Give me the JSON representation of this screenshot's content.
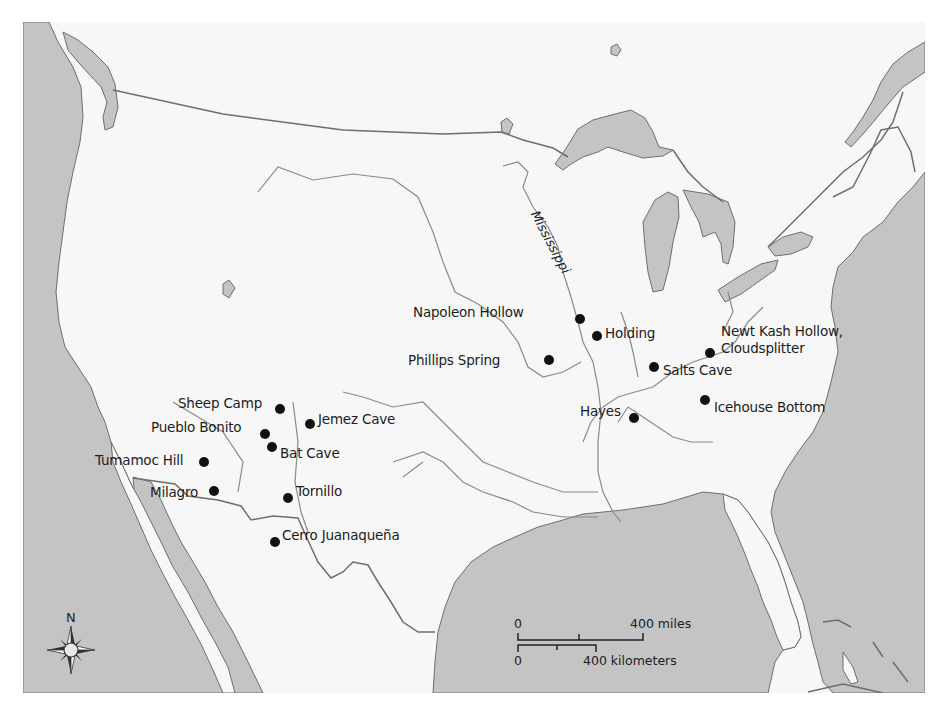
{
  "map": {
    "colors": {
      "land": "#f7f7f7",
      "water": "#c4c4c4",
      "border": "#6e6e6e",
      "river": "#8a8a8a",
      "site_dot": "#111111"
    },
    "river_labels": [
      {
        "id": "mississippi",
        "label": "Mississippi"
      }
    ],
    "sites": [
      {
        "id": "napoleon-hollow",
        "label": "Napoleon Hollow"
      },
      {
        "id": "holding",
        "label": "Holding"
      },
      {
        "id": "newt-kash-1",
        "label": "Newt Kash Hollow,"
      },
      {
        "id": "newt-kash-2",
        "label": "Cloudsplitter"
      },
      {
        "id": "phillips-spring",
        "label": "Phillips Spring"
      },
      {
        "id": "salts-cave",
        "label": "Salts Cave"
      },
      {
        "id": "hayes",
        "label": "Hayes"
      },
      {
        "id": "icehouse-bottom",
        "label": "Icehouse Bottom"
      },
      {
        "id": "sheep-camp",
        "label": "Sheep Camp"
      },
      {
        "id": "jemez-cave",
        "label": "Jemez Cave"
      },
      {
        "id": "pueblo-bonito",
        "label": "Pueblo Bonito"
      },
      {
        "id": "bat-cave",
        "label": "Bat Cave"
      },
      {
        "id": "tumamoc-hill",
        "label": "Tumamoc Hill"
      },
      {
        "id": "milagro",
        "label": "Milagro"
      },
      {
        "id": "tornillo",
        "label": "Tornillo"
      },
      {
        "id": "cerro-juanaquena",
        "label": "Cerro Juanaqueña"
      }
    ],
    "compass": {
      "label": "N"
    },
    "scale_bar": {
      "miles_start": "0",
      "miles_end": "400 miles",
      "km_start": "0",
      "km_end": "400 kilometers"
    }
  }
}
